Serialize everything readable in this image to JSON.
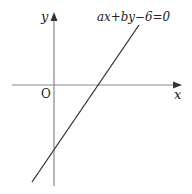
{
  "diagram": {
    "type": "coordinate-plane-line",
    "axes": {
      "x_label": "x",
      "y_label": "y",
      "origin_label": "O",
      "x_axis": {
        "x1": 12,
        "y": 85,
        "x2": 181
      },
      "y_axis": {
        "x": 54,
        "y1": 186,
        "y2": 13
      },
      "color": "#888888"
    },
    "line": {
      "equation": "ax+by−6=0",
      "x1": 32,
      "y1": 182,
      "x2": 139,
      "y2": 25,
      "color": "#333333",
      "x_intercept_px": [
        98,
        85
      ],
      "y_intercept_px": [
        54,
        151
      ],
      "x_intercept_sign": "positive",
      "y_intercept_sign": "negative"
    }
  }
}
